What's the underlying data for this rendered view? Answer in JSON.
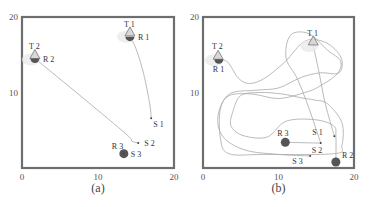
{
  "chart_data": [
    {
      "type": "line",
      "panel": "a",
      "caption": "(a)",
      "xlim": [
        0,
        20
      ],
      "ylim": [
        0,
        20
      ],
      "xticks": [
        "0",
        "10",
        "20"
      ],
      "yticks": [
        "10",
        "20"
      ],
      "grid": false,
      "markers": [
        {
          "label": "T 1",
          "kind": "target",
          "x": 14.2,
          "y": 17.9
        },
        {
          "label": "R 1",
          "kind": "robot-half",
          "x": 14.2,
          "y": 17.4
        },
        {
          "label": "T 2",
          "kind": "target",
          "x": 1.7,
          "y": 14.9
        },
        {
          "label": "R 2",
          "kind": "robot-half",
          "x": 1.7,
          "y": 14.5
        },
        {
          "label": "S 1",
          "kind": "start",
          "x": 17.0,
          "y": 6.6
        },
        {
          "label": "S 2",
          "kind": "start",
          "x": 15.3,
          "y": 3.3
        },
        {
          "label": "R 3",
          "kind": "robot",
          "x": 13.4,
          "y": 1.9
        },
        {
          "label": "S 3",
          "kind": "start",
          "x": 13.4,
          "y": 1.9
        }
      ],
      "series": [
        {
          "name": "R1 path",
          "points": [
            [
              17.0,
              6.6
            ],
            [
              16.8,
              8.5
            ],
            [
              16.0,
              12.5
            ],
            [
              15.0,
              15.8
            ],
            [
              14.2,
              17.4
            ]
          ]
        },
        {
          "name": "R2 path",
          "points": [
            [
              15.3,
              3.3
            ],
            [
              14.4,
              3.6
            ],
            [
              13.8,
              4.4
            ],
            [
              8.0,
              9.3
            ],
            [
              1.7,
              14.5
            ]
          ]
        }
      ]
    },
    {
      "type": "line",
      "panel": "b",
      "caption": "(b)",
      "xlim": [
        0,
        20
      ],
      "ylim": [
        0,
        20
      ],
      "xticks": [
        "0",
        "10",
        "20"
      ],
      "yticks": [
        "10",
        "20"
      ],
      "grid": false,
      "markers": [
        {
          "label": "T 1",
          "kind": "target",
          "x": 14.6,
          "y": 16.7
        },
        {
          "label": "T 2",
          "kind": "target",
          "x": 2.0,
          "y": 14.8
        },
        {
          "label": "R 1",
          "kind": "robot-half",
          "x": 2.1,
          "y": 14.4
        },
        {
          "label": "S 1",
          "kind": "start",
          "x": 17.4,
          "y": 4.2
        },
        {
          "label": "S 2",
          "kind": "start",
          "x": 15.6,
          "y": 3.3
        },
        {
          "label": "S 3",
          "kind": "start",
          "x": 14.2,
          "y": 1.6
        },
        {
          "label": "R 3",
          "kind": "robot",
          "x": 10.9,
          "y": 3.4
        },
        {
          "label": "R 2",
          "kind": "robot",
          "x": 17.6,
          "y": 0.8
        }
      ],
      "series": [
        {
          "name": "R1 path",
          "points": [
            [
              17.4,
              4.2
            ],
            [
              16.2,
              8.5
            ],
            [
              15.4,
              12.5
            ],
            [
              14.6,
              16.3
            ]
          ]
        },
        {
          "name": "R2 path",
          "points": [
            [
              15.6,
              3.3
            ],
            [
              14.0,
              8.0
            ],
            [
              12.5,
              11.8
            ],
            [
              11.0,
              14.6
            ],
            [
              11.6,
              17.6
            ],
            [
              14.0,
              17.8
            ],
            [
              16.5,
              15.6
            ],
            [
              18.2,
              14.2
            ],
            [
              17.8,
              12.5
            ],
            [
              15.4,
              10.8
            ],
            [
              13.5,
              10.0
            ],
            [
              10.0,
              9.2
            ],
            [
              6.5,
              9.8
            ],
            [
              3.5,
              9.6
            ],
            [
              2.3,
              7.8
            ],
            [
              2.3,
              4.0
            ],
            [
              3.4,
              1.9
            ],
            [
              8.0,
              1.8
            ],
            [
              17.4,
              1.9
            ],
            [
              18.4,
              3.0
            ],
            [
              18.4,
              6.0
            ],
            [
              16.5,
              8.5
            ],
            [
              14.8,
              9.0
            ],
            [
              13.0,
              9.3
            ],
            [
              10.5,
              9.8
            ],
            [
              7.5,
              10.0
            ],
            [
              5.0,
              9.6
            ],
            [
              4.0,
              7.6
            ],
            [
              3.7,
              5.6
            ],
            [
              5.3,
              4.3
            ],
            [
              8.5,
              4.1
            ],
            [
              11.0,
              6.2
            ],
            [
              14.8,
              6.4
            ],
            [
              17.3,
              5.6
            ],
            [
              17.6,
              4.2
            ],
            [
              17.6,
              0.8
            ]
          ]
        },
        {
          "name": "R3 path",
          "points": [
            [
              14.2,
              1.6
            ],
            [
              10.0,
              1.8
            ],
            [
              5.5,
              2.4
            ],
            [
              2.6,
              4.2
            ],
            [
              2.0,
              7.0
            ],
            [
              3.5,
              9.8
            ],
            [
              7.0,
              10.3
            ],
            [
              10.0,
              10.6
            ],
            [
              13.0,
              12.0
            ],
            [
              15.5,
              12.6
            ],
            [
              18.0,
              12.6
            ],
            [
              18.3,
              14.6
            ],
            [
              16.3,
              16.6
            ],
            [
              13.5,
              16.8
            ],
            [
              10.8,
              14.0
            ],
            [
              8.0,
              11.8
            ],
            [
              6.0,
              11.2
            ],
            [
              4.6,
              12.0
            ],
            [
              3.3,
              14.0
            ],
            [
              2.1,
              14.4
            ]
          ]
        },
        {
          "name": "R3 final",
          "points": [
            [
              10.9,
              3.4
            ],
            [
              15.6,
              3.3
            ]
          ]
        }
      ]
    }
  ]
}
